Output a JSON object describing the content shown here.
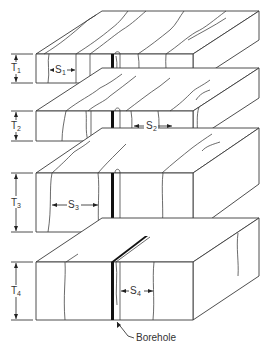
{
  "diagram": {
    "type": "block diagram of stacked rock layers with joint spacing",
    "layers": [
      {
        "thickness_label": "T",
        "thickness_sub": "1",
        "spacing_label": "S",
        "spacing_sub": "1"
      },
      {
        "thickness_label": "T",
        "thickness_sub": "2",
        "spacing_label": "S",
        "spacing_sub": "2"
      },
      {
        "thickness_label": "T",
        "thickness_sub": "3",
        "spacing_label": "S",
        "spacing_sub": "3"
      },
      {
        "thickness_label": "T",
        "thickness_sub": "4",
        "spacing_label": "S",
        "spacing_sub": "4"
      }
    ],
    "borehole_label": "Borehole",
    "colors": {
      "line": "#3a3a3a",
      "background": "#ffffff",
      "borehole": "#111111"
    }
  }
}
